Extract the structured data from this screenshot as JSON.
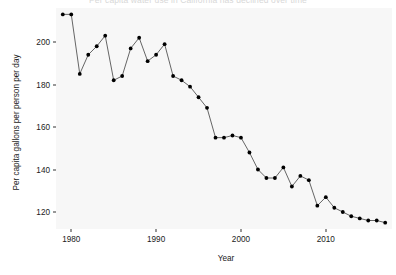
{
  "chart_data": {
    "type": "line",
    "title": "Per capita water use in California has declined over time",
    "xlabel": "Year",
    "ylabel": "Per capita gallons per person per day",
    "xlim": [
      1978.2,
      2017.8
    ],
    "ylim": [
      112,
      216
    ],
    "grid": false,
    "legend": "none",
    "marker": "filled-circle",
    "line_color": "#555555",
    "point_color": "#000000",
    "panel_color": "#f7f7f7",
    "x_ticks": [
      1980,
      1990,
      2000,
      2010
    ],
    "x_tick_labels": [
      "1980",
      "1990",
      "2000",
      "2010"
    ],
    "y_ticks": [
      120,
      140,
      160,
      180,
      200
    ],
    "y_tick_labels": [
      "120",
      "140",
      "160",
      "180",
      "200"
    ],
    "x": [
      1979,
      1980,
      1981,
      1982,
      1983,
      1984,
      1985,
      1986,
      1987,
      1988,
      1989,
      1990,
      1991,
      1992,
      1993,
      1994,
      1995,
      1996,
      1997,
      1998,
      1999,
      2000,
      2001,
      2002,
      2003,
      2004,
      2005,
      2006,
      2007,
      2008,
      2009,
      2010,
      2011,
      2012,
      2013,
      2014,
      2015,
      2016,
      2017
    ],
    "values": [
      213,
      213,
      185,
      194,
      198,
      203,
      182,
      184,
      197,
      202,
      191,
      194,
      199,
      184,
      182,
      179,
      174,
      169,
      155,
      155,
      156,
      155,
      148,
      140,
      136,
      136,
      141,
      132,
      137,
      135,
      123,
      127,
      122,
      120,
      118,
      117,
      116,
      116,
      115
    ],
    "series": [
      {
        "name": "Per capita gallons per person per day",
        "values": [
          213,
          213,
          185,
          194,
          198,
          203,
          182,
          184,
          197,
          202,
          191,
          194,
          199,
          184,
          182,
          179,
          174,
          169,
          155,
          155,
          156,
          155,
          148,
          140,
          136,
          136,
          141,
          132,
          137,
          135,
          123,
          127,
          122,
          120,
          118,
          117,
          116,
          116,
          115
        ]
      }
    ]
  }
}
